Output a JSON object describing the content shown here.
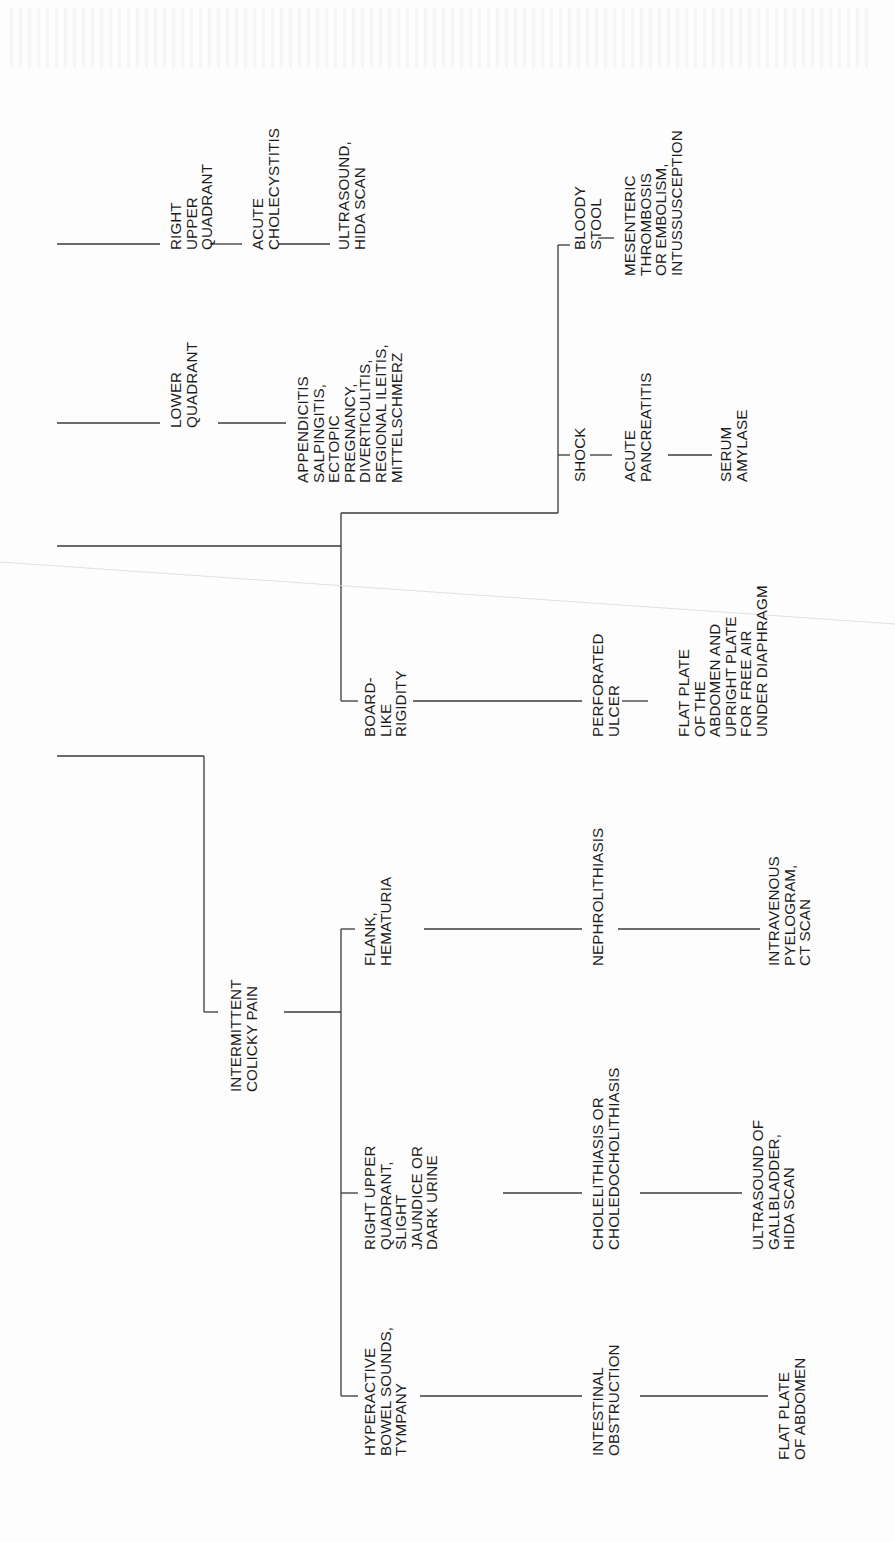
{
  "diagram": {
    "type": "decision-tree",
    "orientation": "rotated-90-ccw",
    "line_color": "#3a3a3a",
    "text_color": "#1c1c1c",
    "nodes": [
      {
        "id": "ruq",
        "lines": [
          "RIGHT",
          "UPPER",
          "QUADRANT"
        ],
        "x": 168,
        "y": 250
      },
      {
        "id": "acute-cholecystitis",
        "lines": [
          "ACUTE",
          "CHOLECYSTITIS"
        ],
        "x": 250,
        "y": 250
      },
      {
        "id": "ultrasound-hida",
        "lines": [
          "ULTRASOUND,",
          "HIDA SCAN"
        ],
        "x": 336,
        "y": 250
      },
      {
        "id": "lower-quadrant",
        "lines": [
          "LOWER",
          "QUADRANT"
        ],
        "x": 168,
        "y": 428
      },
      {
        "id": "appendicitis-group",
        "lines": [
          "APPENDICITIS",
          "SALPINGITIS,",
          "ECTOPIC",
          "PREGNANCY,",
          "DIVERTICULITIS,",
          "REGIONAL ILEITIS,",
          "MITTELSCHMERZ"
        ],
        "x": 295,
        "y": 483
      },
      {
        "id": "bloody-stool",
        "lines": [
          "BLOODY",
          "STOOL"
        ],
        "x": 572,
        "y": 250
      },
      {
        "id": "mesenteric",
        "lines": [
          "MESENTERIC",
          "THROMBOSIS",
          "OR EMBOLISM,",
          "INTUSSUSCEPTION"
        ],
        "x": 622,
        "y": 276
      },
      {
        "id": "shock",
        "lines": [
          "SHOCK"
        ],
        "x": 572,
        "y": 482
      },
      {
        "id": "acute-pancreatitis",
        "lines": [
          "ACUTE",
          "PANCREATITIS"
        ],
        "x": 622,
        "y": 482
      },
      {
        "id": "serum-amylase",
        "lines": [
          "SERUM",
          "AMYLASE"
        ],
        "x": 718,
        "y": 482
      },
      {
        "id": "board-like-rigidity",
        "lines": [
          "BOARD-",
          "LIKE",
          "RIGIDITY"
        ],
        "x": 362,
        "y": 737
      },
      {
        "id": "perforated-ulcer",
        "lines": [
          "PERFORATED",
          "ULCER"
        ],
        "x": 590,
        "y": 737
      },
      {
        "id": "flat-plate-free-air",
        "lines": [
          "FLAT PLATE",
          "OF THE",
          "ABDOMEN AND",
          "UPRIGHT PLATE",
          "FOR FREE AIR",
          "UNDER DIAPHRAGM"
        ],
        "x": 676,
        "y": 737
      },
      {
        "id": "intermittent-colicky-pain",
        "lines": [
          "INTERMITTENT",
          "COLICKY PAIN"
        ],
        "x": 228,
        "y": 1092
      },
      {
        "id": "flank-hematuria",
        "lines": [
          "FLANK,",
          "HEMATURIA"
        ],
        "x": 362,
        "y": 966
      },
      {
        "id": "nephrolithiasis",
        "lines": [
          "NEPHROLITHIASIS"
        ],
        "x": 590,
        "y": 966
      },
      {
        "id": "ivp-ct",
        "lines": [
          "INTRAVENOUS",
          "PYELOGRAM,",
          "CT SCAN"
        ],
        "x": 766,
        "y": 966
      },
      {
        "id": "ruq-jaundice",
        "lines": [
          "RIGHT UPPER",
          "QUADRANT,",
          "SLIGHT",
          "JAUNDICE OR",
          "DARK URINE"
        ],
        "x": 362,
        "y": 1250
      },
      {
        "id": "cholelithiasis",
        "lines": [
          "CHOLELITHIASIS OR",
          "CHOLEDOCHOLITHIASIS"
        ],
        "x": 590,
        "y": 1250
      },
      {
        "id": "ultrasound-gallbladder",
        "lines": [
          "ULTRASOUND OF",
          "GALLBLADDER,",
          "HIDA SCAN"
        ],
        "x": 750,
        "y": 1250
      },
      {
        "id": "hyperactive-bowel",
        "lines": [
          "HYPERACTIVE",
          "BOWEL SOUNDS,",
          "TYMPANY"
        ],
        "x": 362,
        "y": 1456
      },
      {
        "id": "intestinal-obstruction",
        "lines": [
          "INTESTINAL",
          "OBSTRUCTION"
        ],
        "x": 590,
        "y": 1456
      },
      {
        "id": "flat-plate-abdomen",
        "lines": [
          "FLAT PLATE",
          "OF ABDOMEN"
        ],
        "x": 776,
        "y": 1460
      }
    ],
    "edges": [
      [
        57,
        244,
        160,
        244
      ],
      [
        210,
        244,
        242,
        244
      ],
      [
        278,
        244,
        330,
        244
      ],
      [
        57,
        423,
        160,
        423
      ],
      [
        218,
        423,
        286,
        423
      ],
      [
        57,
        546,
        341,
        546
      ],
      [
        341,
        513,
        341,
        701
      ],
      [
        341,
        513,
        558,
        513
      ],
      [
        558,
        245,
        558,
        513
      ],
      [
        558,
        245,
        570,
        245
      ],
      [
        598,
        238,
        614,
        238
      ],
      [
        558,
        455,
        570,
        455
      ],
      [
        590,
        455,
        612,
        455
      ],
      [
        668,
        455,
        712,
        455
      ],
      [
        341,
        701,
        358,
        701
      ],
      [
        413,
        701,
        582,
        701
      ],
      [
        622,
        701,
        648,
        701
      ],
      [
        57,
        756,
        204,
        756
      ],
      [
        204,
        756,
        204,
        1012
      ],
      [
        204,
        1012,
        218,
        1012
      ],
      [
        284,
        1012,
        341,
        1012
      ],
      [
        341,
        929,
        341,
        1396
      ],
      [
        341,
        929,
        355,
        929
      ],
      [
        424,
        929,
        582,
        929
      ],
      [
        618,
        929,
        760,
        929
      ],
      [
        341,
        1193,
        358,
        1193
      ],
      [
        503,
        1193,
        582,
        1193
      ],
      [
        640,
        1193,
        742,
        1193
      ],
      [
        341,
        1396,
        358,
        1396
      ],
      [
        420,
        1396,
        582,
        1396
      ],
      [
        640,
        1396,
        768,
        1396
      ]
    ]
  }
}
